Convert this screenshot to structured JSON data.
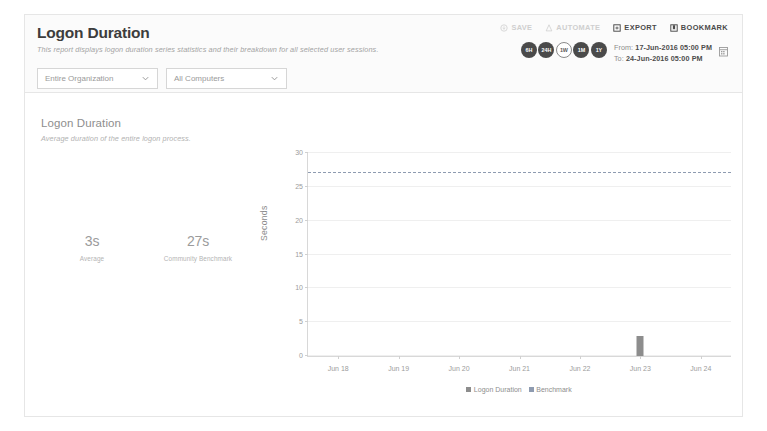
{
  "header": {
    "title": "Logon Duration",
    "subtitle": "This report displays logon duration series statistics and their breakdown for all selected user sessions.",
    "filters": [
      {
        "name": "organization",
        "value": "Entire Organization"
      },
      {
        "name": "computers",
        "value": "All Computers"
      }
    ],
    "actions": [
      {
        "label": "SAVE",
        "icon": "save-icon",
        "disabled": true
      },
      {
        "label": "AUTOMATE",
        "icon": "automate-icon",
        "disabled": true
      },
      {
        "label": "EXPORT",
        "icon": "export-icon",
        "disabled": false
      },
      {
        "label": "BOOKMARK",
        "icon": "bookmark-icon",
        "disabled": false
      }
    ],
    "time_pills": [
      {
        "label": "6H",
        "active": false
      },
      {
        "label": "24H",
        "active": false
      },
      {
        "label": "1W",
        "active": true
      },
      {
        "label": "1M",
        "active": false
      },
      {
        "label": "1Y",
        "active": false
      }
    ],
    "date_range": {
      "from_label": "From:",
      "from_value": "17-Jun-2016 05:00 PM",
      "to_label": "To:",
      "to_value": "24-Jun-2016 05:00 PM"
    },
    "calendar_icon": "calendar-icon"
  },
  "panel": {
    "title": "Logon Duration",
    "subtitle": "Average duration of the entire logon process.",
    "kpis": [
      {
        "value": "3s",
        "label": "Average"
      },
      {
        "value": "27s",
        "label": "Community\nBenchmark"
      }
    ]
  },
  "chart_data": {
    "type": "bar",
    "title": "Logon Duration",
    "subtitle": "Average duration of the entire logon process.",
    "xlabel": "",
    "ylabel": "Seconds",
    "ylim": [
      0,
      30
    ],
    "yticks": [
      0,
      5,
      10,
      15,
      20,
      25,
      30
    ],
    "grid": true,
    "categories": [
      "Jun 18",
      "Jun 19",
      "Jun 20",
      "Jun 21",
      "Jun 22",
      "Jun 23",
      "Jun 24"
    ],
    "series": [
      {
        "name": "Logon Duration",
        "type": "bar",
        "color": "#8d8d8d",
        "values": [
          0,
          0,
          0,
          0,
          0,
          3,
          0
        ]
      },
      {
        "name": "Benchmark",
        "type": "line",
        "style": "dashed",
        "color": "#8e9bb0",
        "constant": 27,
        "values": [
          27,
          27,
          27,
          27,
          27,
          27,
          27
        ]
      }
    ],
    "legend": [
      "Logon Duration",
      "Benchmark"
    ],
    "legend_position": "bottom"
  }
}
